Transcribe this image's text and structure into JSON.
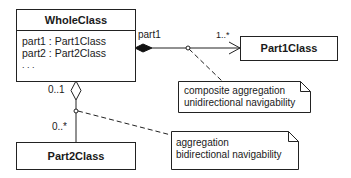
{
  "classes": {
    "whole": {
      "name": "WholeClass",
      "attributes": [
        "part1 : Part1Class",
        "part2 : Part2Class",
        ". . ."
      ]
    },
    "part1": {
      "name": "Part1Class"
    },
    "part2": {
      "name": "Part2Class"
    }
  },
  "associations": {
    "composite": {
      "role": "part1",
      "multiplicity_target": "1..*",
      "kind": "composite",
      "navigability": "unidirectional"
    },
    "aggregation": {
      "multiplicity_whole": "0..1",
      "multiplicity_part": "0..*",
      "kind": "aggregation",
      "navigability": "bidirectional"
    }
  },
  "notes": {
    "note1": {
      "line1": "composite aggregation",
      "line2": "unidirectional navigability"
    },
    "note2": {
      "line1": "aggregation",
      "line2": "bidirectional navigability"
    }
  },
  "colors": {
    "line": "#222222",
    "background": "#ffffff"
  }
}
